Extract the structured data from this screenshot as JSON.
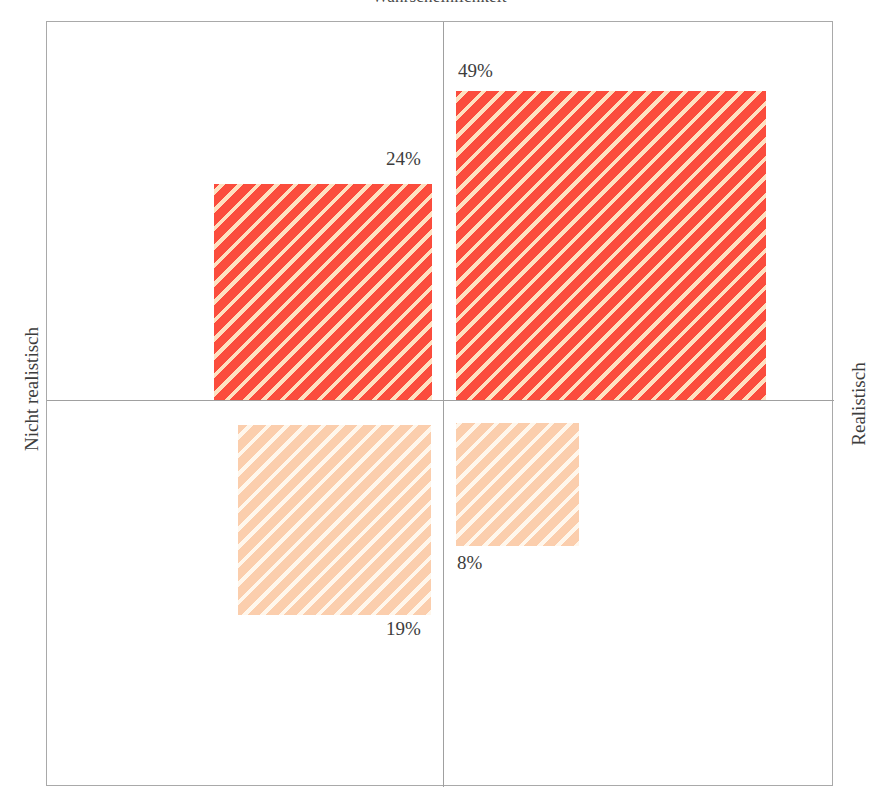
{
  "chart_data": {
    "type": "bar",
    "title": "Wahrscheinlichkeit",
    "subtitle": "",
    "xlabel": "",
    "ylabel": "",
    "grid": false,
    "legend_position": "none",
    "axis_captions": {
      "left": "Nicht realistisch",
      "right": "Realistisch"
    },
    "categories": [
      "Nicht realistisch / oben",
      "Realistisch / oben",
      "Nicht realistisch / unten",
      "Realistisch / unten"
    ],
    "values": [
      24,
      49,
      19,
      8
    ],
    "value_labels": [
      "24%",
      "49%",
      "19%",
      "8%"
    ],
    "quadrants": [
      {
        "position": "top-left",
        "label": "24%",
        "value": 24,
        "color": "#fb4d3d",
        "style": "hatched-strong"
      },
      {
        "position": "top-right",
        "label": "49%",
        "value": 49,
        "color": "#fb4d3d",
        "style": "hatched-strong"
      },
      {
        "position": "bottom-left",
        "label": "19%",
        "value": 19,
        "color": "#fbcead",
        "style": "hatched-light"
      },
      {
        "position": "bottom-right",
        "label": "8%",
        "value": 8,
        "color": "#fbcead",
        "style": "hatched-light"
      }
    ],
    "colors": {
      "strong": "#fb4d3d",
      "light": "#fbcead",
      "frame": "#a9a9a9",
      "axis": "#a0a0a0",
      "text": "#3d3d3d",
      "background": "#ffffff"
    }
  }
}
